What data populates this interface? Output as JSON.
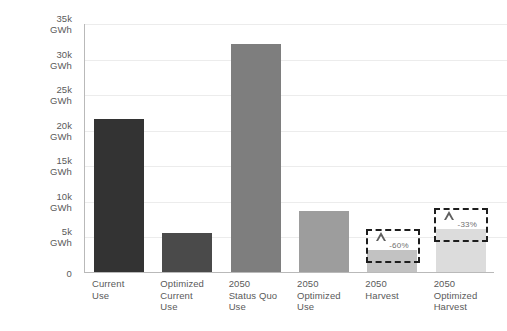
{
  "chart_data": {
    "type": "bar",
    "title": "",
    "subtitle": "",
    "xlabel": "",
    "ylabel": "",
    "unit": "GWh",
    "ylim": [
      0,
      35000
    ],
    "grid": true,
    "legend": "none",
    "categories": [
      "Current\nUse",
      "Optimized\nCurrent\nUse",
      "2050\nStatus Quo\nUse",
      "2050\nOptimized\nUse",
      "2050\nHarvest",
      "2050\nOptimized\nHarvest"
    ],
    "values": [
      21500,
      5500,
      32000,
      8600,
      3100,
      6100
    ],
    "bar_colors": [
      "#333333",
      "#4a4a4a",
      "#7e7e7e",
      "#9d9d9d",
      "#c2c2c2",
      "#dcdcdc"
    ],
    "ytick_labels": [
      "0",
      "5k\nGWh",
      "10k\nGWh",
      "15k\nGWh",
      "20k\nGWh",
      "25k\nGWh",
      "30k\nGWh",
      "35k\nGWh"
    ],
    "ytick_values": [
      0,
      5000,
      10000,
      15000,
      20000,
      25000,
      30000,
      35000
    ],
    "annotations": [
      {
        "category": "2050\nHarvest",
        "label": "-60%",
        "icon": "delta-triangle"
      },
      {
        "category": "2050\nOptimized\nHarvest",
        "label": "-33%",
        "icon": "delta-triangle"
      }
    ]
  },
  "colors": {
    "background": "#ffffff",
    "axis": "#b9b9b9",
    "gridline": "#ececec",
    "text": "#5a5a5a",
    "badge_border": "#1d1d1d",
    "badge_text": "#6f6f6f"
  }
}
